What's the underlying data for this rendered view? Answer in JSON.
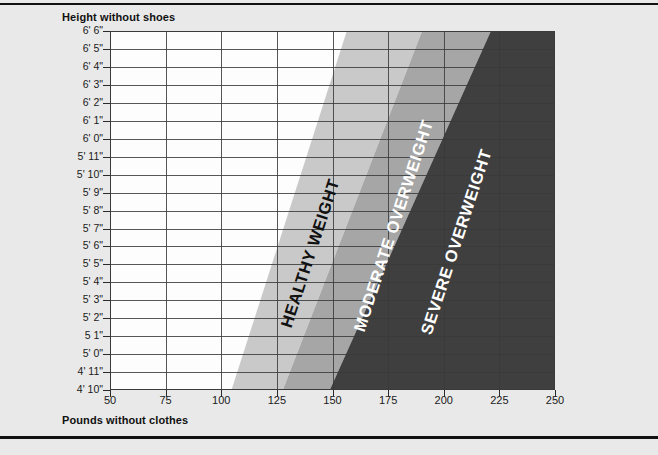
{
  "chart": {
    "y_axis_title": "Height without shoes",
    "x_axis_title": "Pounds without clothes"
  },
  "chart_data": {
    "type": "area",
    "title": "",
    "xlabel": "Pounds without clothes",
    "ylabel": "Height without shoes",
    "xlim": [
      50,
      250
    ],
    "ylim": [
      58,
      78
    ],
    "grid": true,
    "legend": "none",
    "x_ticks": [
      50,
      75,
      100,
      125,
      150,
      175,
      200,
      225,
      250
    ],
    "x_tick_labels": [
      "50",
      "75",
      "100",
      "125",
      "150",
      "175",
      "200",
      "225",
      "250"
    ],
    "y_tick_labels": [
      "6' 6\"",
      "6' 5\"",
      "6' 4\"",
      "6' 3\"",
      "6' 2\"",
      "6' 1\"",
      "6' 0\"",
      "5' 11\"",
      "5' 10\"",
      "5' 9\"",
      "5' 8\"",
      "5' 7\"",
      "5' 6\"",
      "5' 5\"",
      "5' 4\"",
      "5' 3\"",
      "5' 2\"",
      "5 1\"",
      "5' 0\"",
      "4' 11\"",
      "4' 10\""
    ],
    "y_tick_inches": [
      78,
      77,
      76,
      75,
      74,
      73,
      72,
      71,
      70,
      69,
      68,
      67,
      66,
      65,
      64,
      63,
      62,
      61,
      60,
      59,
      58
    ],
    "regions": [
      {
        "name": "underweight",
        "label": "",
        "color": "#fdfdfd",
        "label_color": "#111111",
        "boundary_lower_lbs": [
          50,
          50
        ],
        "boundary_upper_lbs": [
          157,
          104
        ],
        "boundary_at_heights": [
          78,
          58
        ]
      },
      {
        "name": "healthy-weight",
        "label": "HEALTHY WEIGHT",
        "color": "#c9c9c9",
        "label_color": "#111111",
        "boundary_lower_lbs": [
          157,
          104
        ],
        "boundary_upper_lbs": [
          191,
          127
        ],
        "boundary_at_heights": [
          78,
          58
        ]
      },
      {
        "name": "moderate-overweight",
        "label": "MODERATE OVERWEIGHT",
        "color": "#a6a6a6",
        "label_color": "#ffffff",
        "boundary_lower_lbs": [
          191,
          127
        ],
        "boundary_upper_lbs": [
          222,
          148
        ],
        "boundary_at_heights": [
          78,
          58
        ]
      },
      {
        "name": "severe-overweight",
        "label": "SEVERE OVERWEIGHT",
        "color": "#3f3f3f",
        "label_color": "#ffffff",
        "boundary_lower_lbs": [
          222,
          148
        ],
        "boundary_upper_lbs": [
          250,
          250
        ],
        "boundary_at_heights": [
          78,
          58
        ]
      }
    ]
  }
}
